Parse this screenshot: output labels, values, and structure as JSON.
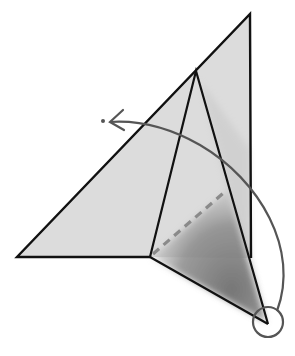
{
  "diagram": {
    "type": "origami-fold-instruction",
    "colors": {
      "paper_fill": "#dcdcdc",
      "paper_edge": "#111111",
      "shadow": "#7a7a7a",
      "valley_fold_dash": "#8a8a8a",
      "arrow": "#555555",
      "highlight_circle": "#555555",
      "background": "#ffffff"
    },
    "elements": [
      {
        "id": "outer-flap",
        "kind": "polygon",
        "description": "large triangular flap of paper"
      },
      {
        "id": "inner-flap",
        "kind": "polygon",
        "description": "narrow inner flap with shaded underside"
      },
      {
        "id": "shadow-region",
        "kind": "shading",
        "description": "dark shaded triangle behind flap"
      },
      {
        "id": "valley-fold-line",
        "kind": "dashed-line",
        "description": "valley fold guideline"
      },
      {
        "id": "fold-arrow",
        "kind": "curved-arrow",
        "description": "arc arrow from bottom point to upper-left target"
      },
      {
        "id": "target-dot",
        "kind": "dot",
        "description": "destination point of fold"
      },
      {
        "id": "highlight-circle",
        "kind": "circle",
        "description": "circle marking the point to be folded"
      }
    ]
  }
}
